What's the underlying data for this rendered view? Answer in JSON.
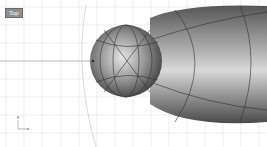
{
  "viewport": {
    "label": "Top",
    "type": "rhino-3d-top-viewport",
    "grid_spacing_px": 18,
    "colors": {
      "background": "#ffffff",
      "grid_minor": "#e4e4e4",
      "grid_major": "#9a9a9a",
      "label_bg": "#8e8e8e",
      "surface_dark": "#404040",
      "surface_light": "#e8e8e8"
    },
    "objects": [
      {
        "name": "sphere",
        "shape": "sphere"
      },
      {
        "name": "elongated-body",
        "shape": "ellipsoid"
      }
    ],
    "axis_icon": {
      "x_label": "x",
      "y_label": "y"
    }
  }
}
